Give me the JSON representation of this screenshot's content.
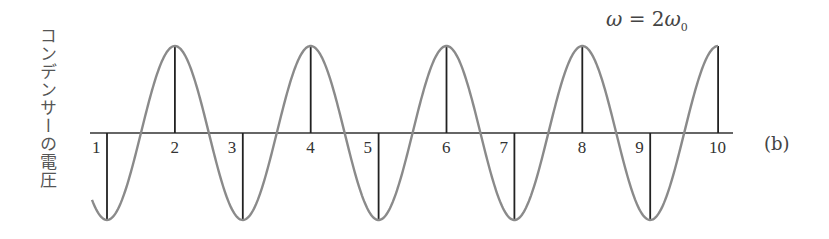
{
  "figure": {
    "y_axis_label": "コンデンサーの電圧",
    "formula": {
      "lhs": "ω",
      "eq": "=",
      "coef": "2",
      "symbol": "ω",
      "subscript": "0"
    },
    "panel_label": "(b)",
    "colors": {
      "curve": "#8a8a8a",
      "axis": "#333333",
      "sample_lines": "#222222",
      "text": "#333333"
    }
  },
  "chart_data": {
    "type": "line",
    "title": "ω = 2ω0",
    "ylabel": "コンデンサーの電圧",
    "xlabel": "",
    "panel": "(b)",
    "sample_points": [
      {
        "label": "1",
        "value": -1
      },
      {
        "label": "2",
        "value": 1
      },
      {
        "label": "3",
        "value": -1
      },
      {
        "label": "4",
        "value": 1
      },
      {
        "label": "5",
        "value": -1
      },
      {
        "label": "6",
        "value": 1
      },
      {
        "label": "7",
        "value": -1
      },
      {
        "label": "8",
        "value": 1
      },
      {
        "label": "9",
        "value": -1
      },
      {
        "label": "10",
        "value": 1
      }
    ],
    "grid": false,
    "legend": null
  }
}
